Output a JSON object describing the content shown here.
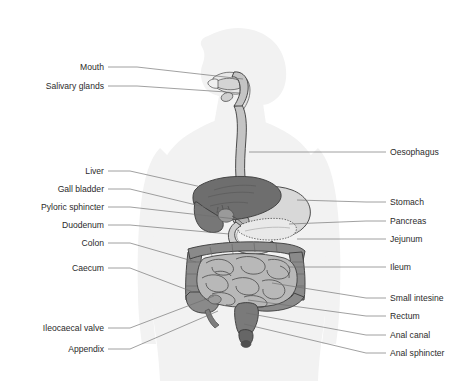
{
  "figure": {
    "background_color": "#ffffff",
    "body_silhouette_color": "#f2f2f2",
    "label_text_color": "#2b2b2b",
    "leader_line_color": "#6d6d6d"
  },
  "organs": {
    "liver": {
      "name": "Liver",
      "fill": "#6e6e6e"
    },
    "gall_bladder": {
      "name": "Gall bladder",
      "fill": "#8f8f8f"
    },
    "stomach": {
      "name": "Stomach",
      "fill": "#d8d8d8"
    },
    "pancreas": {
      "name": "Pancreas",
      "fill": "#e6e6e6"
    },
    "duodenum": {
      "name": "Duodenum",
      "fill": "#c9c9c9"
    },
    "colon": {
      "name": "Colon",
      "fill": "#8a8a8a"
    },
    "small_intestine": {
      "name": "Small intestine",
      "fill": "#b8b8b8"
    },
    "oesophagus": {
      "name": "Oesophagus",
      "fill": "#c4c4c4"
    },
    "rectum": {
      "name": "Rectum",
      "fill": "#7a7a7a"
    }
  },
  "labels_left": [
    {
      "id": "mouth",
      "text": "Mouth",
      "text_x": 104,
      "text_y": 70,
      "dash_x1": 108,
      "dash_y1": 67,
      "dash_x2": 137,
      "dash_y2": 67,
      "line_x1": 137,
      "line_y1": 67,
      "line_x2": 243,
      "line_y2": 79
    },
    {
      "id": "salivary-glands",
      "text": "Salivary glands",
      "text_x": 104,
      "text_y": 89,
      "dash_x1": 108,
      "dash_y1": 86,
      "dash_x2": 137,
      "dash_y2": 86,
      "line_x1": 137,
      "line_y1": 86,
      "line_x2": 241,
      "line_y2": 93
    },
    {
      "id": "liver",
      "text": "Liver",
      "text_x": 104,
      "text_y": 174,
      "dash_x1": 108,
      "dash_y1": 171,
      "dash_x2": 130,
      "dash_y2": 171,
      "line_x1": 130,
      "line_y1": 171,
      "line_x2": 206,
      "line_y2": 188
    },
    {
      "id": "gall-bladder",
      "text": "Gall bladder",
      "text_x": 104,
      "text_y": 192,
      "dash_x1": 108,
      "dash_y1": 189,
      "dash_x2": 130,
      "dash_y2": 189,
      "line_x1": 130,
      "line_y1": 189,
      "line_x2": 221,
      "line_y2": 211
    },
    {
      "id": "pyloric-sphincter",
      "text": "Pyloric sphincter",
      "text_x": 104,
      "text_y": 210,
      "dash_x1": 108,
      "dash_y1": 207,
      "dash_x2": 130,
      "dash_y2": 207,
      "line_x1": 130,
      "line_y1": 207,
      "line_x2": 236,
      "line_y2": 219
    },
    {
      "id": "duodenum",
      "text": "Duodenum",
      "text_x": 104,
      "text_y": 228,
      "dash_x1": 108,
      "dash_y1": 225,
      "dash_x2": 130,
      "dash_y2": 225,
      "line_x1": 130,
      "line_y1": 225,
      "line_x2": 229,
      "line_y2": 234
    },
    {
      "id": "colon",
      "text": "Colon",
      "text_x": 104,
      "text_y": 246,
      "dash_x1": 108,
      "dash_y1": 243,
      "dash_x2": 130,
      "dash_y2": 243,
      "line_x1": 130,
      "line_y1": 243,
      "line_x2": 196,
      "line_y2": 262
    },
    {
      "id": "caecum",
      "text": "Caecum",
      "text_x": 104,
      "text_y": 271,
      "dash_x1": 108,
      "dash_y1": 268,
      "dash_x2": 130,
      "dash_y2": 268,
      "line_x1": 130,
      "line_y1": 268,
      "line_x2": 193,
      "line_y2": 292
    },
    {
      "id": "ileocaecal-valve",
      "text": "Ileocaecal valve",
      "text_x": 104,
      "text_y": 331,
      "dash_x1": 108,
      "dash_y1": 328,
      "dash_x2": 130,
      "dash_y2": 328,
      "line_x1": 130,
      "line_y1": 328,
      "line_x2": 214,
      "line_y2": 296
    },
    {
      "id": "appendix",
      "text": "Appendix",
      "text_x": 104,
      "text_y": 352,
      "dash_x1": 108,
      "dash_y1": 349,
      "dash_x2": 130,
      "dash_y2": 349,
      "line_x1": 130,
      "line_y1": 349,
      "line_x2": 218,
      "line_y2": 311
    }
  ],
  "labels_right": [
    {
      "id": "oesophagus",
      "text": "Oesophagus",
      "text_x": 390,
      "text_y": 155,
      "dash_x1": 386,
      "dash_y1": 152,
      "dash_x2": 366,
      "dash_y2": 152,
      "line_x1": 366,
      "line_y1": 152,
      "line_x2": 249,
      "line_y2": 152
    },
    {
      "id": "stomach",
      "text": "Stomach",
      "text_x": 390,
      "text_y": 205,
      "dash_x1": 386,
      "dash_y1": 202,
      "dash_x2": 366,
      "dash_y2": 202,
      "line_x1": 366,
      "line_y1": 202,
      "line_x2": 297,
      "line_y2": 200
    },
    {
      "id": "pancreas",
      "text": "Pancreas",
      "text_x": 390,
      "text_y": 224,
      "dash_x1": 386,
      "dash_y1": 221,
      "dash_x2": 366,
      "dash_y2": 221,
      "line_x1": 366,
      "line_y1": 221,
      "line_x2": 289,
      "line_y2": 224
    },
    {
      "id": "jejunum",
      "text": "Jejunum",
      "text_x": 390,
      "text_y": 242,
      "dash_x1": 386,
      "dash_y1": 239,
      "dash_x2": 366,
      "dash_y2": 239,
      "line_x1": 366,
      "line_y1": 239,
      "line_x2": 297,
      "line_y2": 239
    },
    {
      "id": "ileum",
      "text": "Ileum",
      "text_x": 390,
      "text_y": 270,
      "dash_x1": 386,
      "dash_y1": 267,
      "dash_x2": 366,
      "dash_y2": 267,
      "line_x1": 366,
      "line_y1": 267,
      "line_x2": 288,
      "line_y2": 267
    },
    {
      "id": "small-intestine",
      "text": "Small intesine",
      "text_x": 390,
      "text_y": 301,
      "dash_x1": 386,
      "dash_y1": 298,
      "dash_x2": 366,
      "dash_y2": 298,
      "line_x1": 366,
      "line_y1": 298,
      "line_x2": 272,
      "line_y2": 283
    },
    {
      "id": "rectum",
      "text": "Rectum",
      "text_x": 390,
      "text_y": 319,
      "dash_x1": 386,
      "dash_y1": 316,
      "dash_x2": 366,
      "dash_y2": 316,
      "line_x1": 366,
      "line_y1": 316,
      "line_x2": 248,
      "line_y2": 300
    },
    {
      "id": "anal-canal",
      "text": "Anal canal",
      "text_x": 390,
      "text_y": 338,
      "dash_x1": 386,
      "dash_y1": 335,
      "dash_x2": 366,
      "dash_y2": 335,
      "line_x1": 366,
      "line_y1": 335,
      "line_x2": 246,
      "line_y2": 313
    },
    {
      "id": "anal-sphincter",
      "text": "Anal sphincter",
      "text_x": 390,
      "text_y": 356,
      "dash_x1": 386,
      "dash_y1": 353,
      "dash_x2": 366,
      "dash_y2": 353,
      "line_x1": 366,
      "line_y1": 353,
      "line_x2": 244,
      "line_y2": 324
    }
  ]
}
